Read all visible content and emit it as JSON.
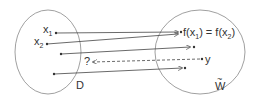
{
  "diagram": {
    "domain_set": {
      "label": "D"
    },
    "codomain_set": {
      "label": "W",
      "label_accent": "~"
    },
    "points_left": [
      {
        "label": "x",
        "sub": "1"
      },
      {
        "label": "x",
        "sub": "2"
      }
    ],
    "image_label": {
      "text_a": "f(x",
      "sub_a": "1",
      "text_b": ") = f(x",
      "sub_b": "2",
      "text_c": ")"
    },
    "preimage_label": "?",
    "target_label": "y"
  }
}
